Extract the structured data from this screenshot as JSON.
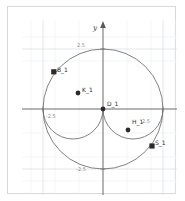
{
  "figure": {
    "title": "",
    "axis_labels": {
      "y": "y",
      "x": ""
    },
    "tick_labels": {
      "y_pos": "2.5",
      "y_neg": "-2.5",
      "x_neg": "-2.5",
      "x_pos": "2.5",
      "origin": ""
    },
    "colors": {
      "background": "#ffffff",
      "grid_minor": "#eceff2",
      "grid_major": "#dfe3e6",
      "axis": "#5a5a5a",
      "curve": "#6b6b6b",
      "point_fill": "#2b2b2b",
      "frame": "#d8d8d8",
      "label_text": "#2e2e2e",
      "tick_text": "#8a8a8a"
    },
    "points": [
      {
        "id": "B_1",
        "label": "B_1",
        "shape": "square",
        "cx": 32,
        "cy": 52
      },
      {
        "id": "K_1",
        "label": "K_1",
        "shape": "circle",
        "cx": 56,
        "cy": 73
      },
      {
        "id": "D_1",
        "label": "D_1",
        "shape": "circle",
        "cx": 81,
        "cy": 89
      },
      {
        "id": "H_1",
        "label": "H_1",
        "shape": "circle",
        "cx": 106,
        "cy": 110
      },
      {
        "id": "S_1",
        "label": "S_1",
        "shape": "square",
        "cx": 130,
        "cy": 126
      }
    ],
    "curves": [
      {
        "id": "outer-circle",
        "type": "circle",
        "cx": 81,
        "cy": 89,
        "r": 60
      },
      {
        "id": "upper-lobe",
        "type": "circle",
        "cx": 51,
        "cy": 89,
        "r": 30
      },
      {
        "id": "lower-lobe",
        "type": "circle",
        "cx": 111,
        "cy": 89,
        "r": 30
      }
    ],
    "axes": {
      "origin_x": 81,
      "origin_y": 89,
      "unit_px": 24
    }
  }
}
